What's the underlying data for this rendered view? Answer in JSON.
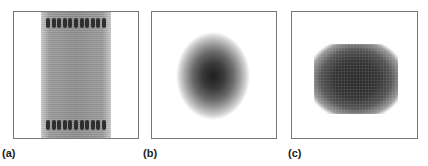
{
  "figure": {
    "panels": [
      {
        "id": "a",
        "label": "(a)",
        "description": "vertical gray band spanning full height with rows of dark dots near top and bottom edges"
      },
      {
        "id": "b",
        "label": "(b)",
        "description": "soft-edged gray blob, darkest at center, fading outward"
      },
      {
        "id": "c",
        "label": "(c)",
        "description": "dark rounded square with uniform dense center"
      }
    ],
    "dot_count_per_row": 11
  }
}
